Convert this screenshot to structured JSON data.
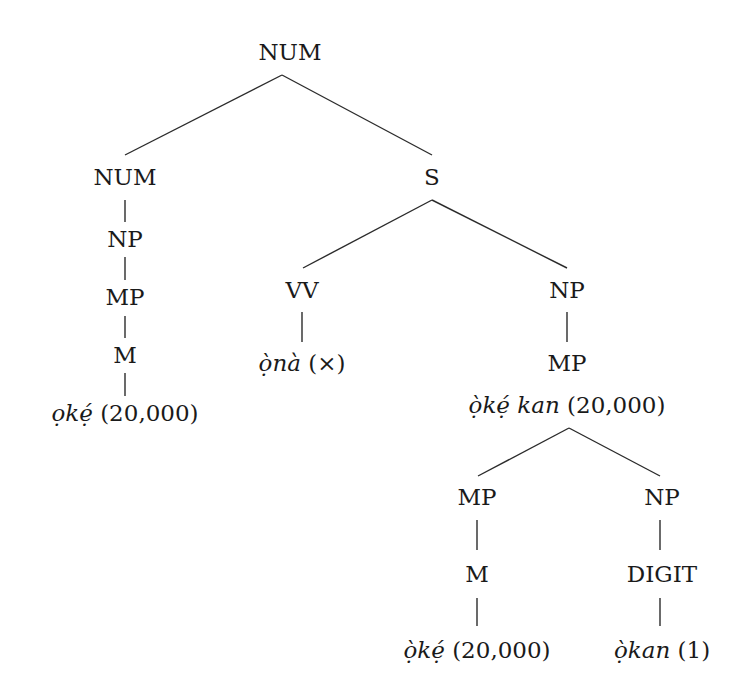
{
  "diagram": {
    "type": "syntax-tree",
    "nodes": {
      "root": {
        "label": "NUM",
        "x": 290,
        "y": 52
      },
      "num_left": {
        "label": "NUM",
        "x": 125,
        "y": 177
      },
      "s": {
        "label": "S",
        "x": 432,
        "y": 177
      },
      "np_left": {
        "label": "NP",
        "x": 125,
        "y": 235
      },
      "mp_left": {
        "label": "MP",
        "x": 125,
        "y": 293
      },
      "m_left": {
        "label": "M",
        "x": 125,
        "y": 351
      },
      "leaf_left": {
        "word": "ọkẹ́",
        "gloss": " (20,000)",
        "x": 125,
        "y": 409
      },
      "vv": {
        "label": "VV",
        "x": 302,
        "y": 287
      },
      "leaf_vv": {
        "word": "ọ̀nà",
        "gloss": " (×)",
        "x": 302,
        "y": 347
      },
      "np_right": {
        "label": "NP",
        "x": 567,
        "y": 287
      },
      "mp_right": {
        "label": "MP",
        "x": 567,
        "y": 344
      },
      "mp_right_text": {
        "word": "ọ̀kẹ́ kan",
        "gloss": " (20,000)",
        "x": 567,
        "y": 381
      },
      "mp_sub": {
        "label": "MP",
        "x": 477,
        "y": 497
      },
      "np_sub": {
        "label": "NP",
        "x": 662,
        "y": 497
      },
      "m_sub": {
        "label": "M",
        "x": 477,
        "y": 573
      },
      "digit": {
        "label": "DIGIT",
        "x": 662,
        "y": 573
      },
      "leaf_m_sub": {
        "word": "ọ̀kẹ́",
        "gloss": " (20,000)",
        "x": 477,
        "y": 648
      },
      "leaf_digit": {
        "word": "ọ̀kan",
        "gloss": " (1)",
        "x": 662,
        "y": 648
      }
    },
    "edges": [
      [
        "root",
        "num_left"
      ],
      [
        "root",
        "s"
      ],
      [
        "num_left",
        "np_left"
      ],
      [
        "np_left",
        "mp_left"
      ],
      [
        "mp_left",
        "m_left"
      ],
      [
        "m_left",
        "leaf_left"
      ],
      [
        "s",
        "vv"
      ],
      [
        "s",
        "np_right"
      ],
      [
        "vv",
        "leaf_vv"
      ],
      [
        "np_right",
        "mp_right"
      ],
      [
        "mp_right_text",
        "mp_sub"
      ],
      [
        "mp_right_text",
        "np_sub"
      ],
      [
        "mp_sub",
        "m_sub"
      ],
      [
        "m_sub",
        "leaf_m_sub"
      ],
      [
        "np_sub",
        "digit"
      ],
      [
        "digit",
        "leaf_digit"
      ]
    ]
  }
}
